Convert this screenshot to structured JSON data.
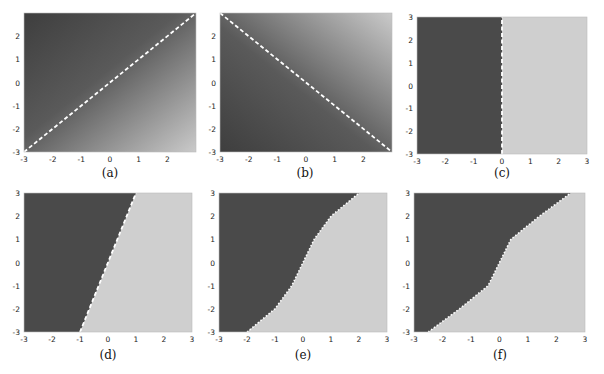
{
  "colors": {
    "dark": "#4a4a4a",
    "light": "#cfcfcf",
    "boundary": "#ffffff"
  },
  "chart_data": [
    {
      "panel": "a",
      "caption": "(a)",
      "type": "heatmap",
      "xlim": [
        -3,
        3
      ],
      "ylim": [
        -3,
        3
      ],
      "xticks": [
        "-3",
        "-2",
        "-1",
        "0",
        "1",
        "2"
      ],
      "yticks": [
        "-3",
        "-2",
        "-1",
        "0",
        "1",
        "2"
      ],
      "fill": "smooth gradient, dark upper-left to light lower-right",
      "boundary": {
        "style": "dashed",
        "equation": "y = x",
        "points": [
          [
            -3,
            -3
          ],
          [
            3,
            3
          ]
        ]
      }
    },
    {
      "panel": "b",
      "caption": "(b)",
      "type": "heatmap",
      "xlim": [
        -3,
        3
      ],
      "ylim": [
        -3,
        3
      ],
      "xticks": [
        "-3",
        "-2",
        "-1",
        "0",
        "1",
        "2"
      ],
      "yticks": [
        "-3",
        "-2",
        "-1",
        "0",
        "1",
        "2"
      ],
      "fill": "smooth gradient, dark lower-left to light upper-right",
      "boundary": {
        "style": "dashed",
        "equation": "y = -x",
        "points": [
          [
            -3,
            3
          ],
          [
            3,
            -3
          ]
        ]
      }
    },
    {
      "panel": "c",
      "caption": "(c)",
      "type": "heatmap",
      "xlim": [
        -3,
        3
      ],
      "ylim": [
        -3,
        3
      ],
      "xticks": [
        "-3",
        "-2",
        "-1",
        "0",
        "1",
        "2",
        "3"
      ],
      "yticks": [
        "-3",
        "-2",
        "-1",
        "0",
        "1",
        "2",
        "3"
      ],
      "fill": "dark for x<0, light for x>0",
      "boundary": {
        "style": "dashed",
        "equation": "x = 0",
        "points": [
          [
            0,
            -3
          ],
          [
            0,
            3
          ]
        ]
      }
    },
    {
      "panel": "d",
      "caption": "(d)",
      "type": "heatmap",
      "xlim": [
        -3,
        3
      ],
      "ylim": [
        -3,
        3
      ],
      "xticks": [
        "-3",
        "-2",
        "-1",
        "0",
        "1",
        "2",
        "3"
      ],
      "yticks": [
        "-3",
        "-2",
        "-1",
        "0",
        "1",
        "2",
        "3"
      ],
      "fill": "dark left region, light right region",
      "boundary": {
        "style": "dashed",
        "equation": "y = 3x",
        "points": [
          [
            -1,
            -3
          ],
          [
            1,
            3
          ]
        ]
      }
    },
    {
      "panel": "e",
      "caption": "(e)",
      "type": "heatmap",
      "xlim": [
        -3,
        3
      ],
      "ylim": [
        -3,
        3
      ],
      "xticks": [
        "-3",
        "-2",
        "-1",
        "0",
        "1",
        "2",
        "3"
      ],
      "yticks": [
        "-3",
        "-2",
        "-1",
        "0",
        "1",
        "2",
        "3"
      ],
      "fill": "dark upper-left region, light lower-right region",
      "boundary": {
        "style": "dotted",
        "shape": "S-curve",
        "points": [
          [
            -2,
            -3
          ],
          [
            -1,
            -2
          ],
          [
            -0.4,
            -1
          ],
          [
            0,
            0
          ],
          [
            0.4,
            1
          ],
          [
            1,
            2
          ],
          [
            2,
            3
          ]
        ]
      }
    },
    {
      "panel": "f",
      "caption": "(f)",
      "type": "heatmap",
      "xlim": [
        -3,
        3
      ],
      "ylim": [
        -3,
        3
      ],
      "xticks": [
        "-3",
        "-2",
        "-1",
        "0",
        "1",
        "2",
        "3"
      ],
      "yticks": [
        "-3",
        "-2",
        "-1",
        "0",
        "1",
        "2",
        "3"
      ],
      "fill": "dark upper-left region, light lower-right region",
      "boundary": {
        "style": "dotted",
        "shape": "S-curve",
        "points": [
          [
            -2.5,
            -3
          ],
          [
            -1.4,
            -2
          ],
          [
            -0.4,
            -1
          ],
          [
            0,
            0
          ],
          [
            0.4,
            1
          ],
          [
            1.4,
            2
          ],
          [
            2.5,
            3
          ]
        ]
      }
    }
  ]
}
